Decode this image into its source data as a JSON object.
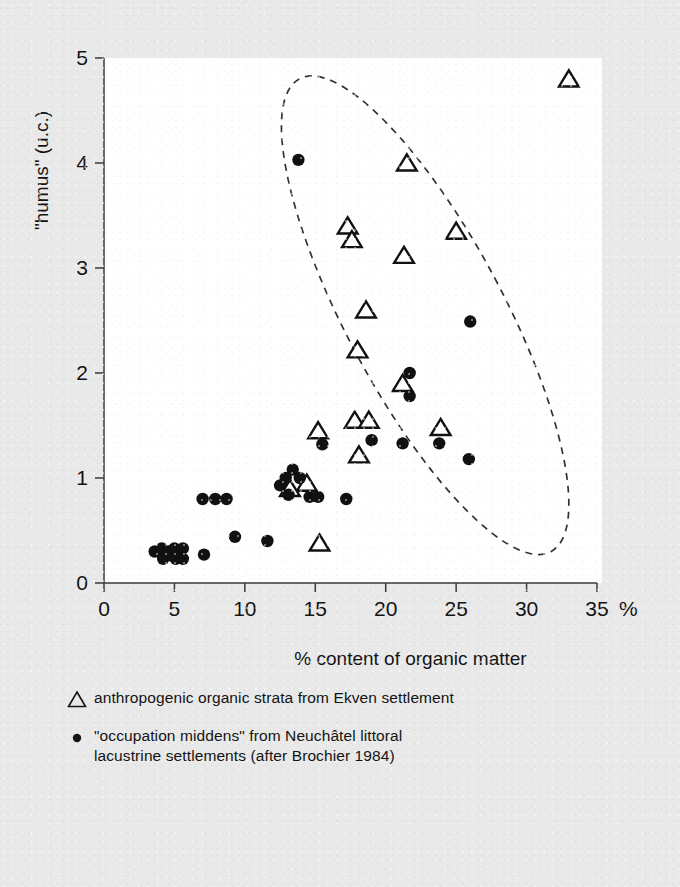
{
  "chart_data": {
    "type": "scatter",
    "title": "",
    "xlabel": "% content of organic matter",
    "ylabel": "\"humus\" (u.c.)",
    "x_unit_suffix": "%",
    "xlim": [
      0,
      35
    ],
    "ylim": [
      0,
      5
    ],
    "x_ticks": [
      "0",
      "5",
      "10",
      "15",
      "20",
      "25",
      "30",
      "35"
    ],
    "x_tick_values": [
      0,
      5,
      10,
      15,
      20,
      25,
      30,
      35
    ],
    "y_ticks": [
      "0",
      "1",
      "2",
      "3",
      "4",
      "5"
    ],
    "y_tick_values": [
      0,
      1,
      2,
      3,
      4,
      5
    ],
    "grid": false,
    "legend_position": "below-axes",
    "marker_color": "#111111",
    "annotation_color": "#333333",
    "series": [
      {
        "name": "anthropogenic organic strata from Ekven settlement",
        "marker": "triangle-open",
        "points": [
          [
            33.0,
            4.8
          ],
          [
            21.5,
            4.0
          ],
          [
            17.3,
            3.4
          ],
          [
            17.6,
            3.27
          ],
          [
            25.0,
            3.35
          ],
          [
            21.3,
            3.12
          ],
          [
            18.6,
            2.6
          ],
          [
            18.0,
            2.22
          ],
          [
            21.2,
            1.9
          ],
          [
            17.8,
            1.55
          ],
          [
            18.8,
            1.55
          ],
          [
            23.9,
            1.48
          ],
          [
            15.2,
            1.45
          ],
          [
            18.1,
            1.22
          ],
          [
            14.4,
            0.95
          ],
          [
            13.2,
            0.9
          ],
          [
            15.3,
            0.38
          ]
        ]
      },
      {
        "name": "\"occupation middens\" from Neuchâtel littoral lacustrine settlements (after Brochier 1984)",
        "marker": "circle-filled",
        "points": [
          [
            13.8,
            4.03
          ],
          [
            26.0,
            2.49
          ],
          [
            21.7,
            2.0
          ],
          [
            21.7,
            1.78
          ],
          [
            21.2,
            1.33
          ],
          [
            23.8,
            1.33
          ],
          [
            19.0,
            1.36
          ],
          [
            15.5,
            1.32
          ],
          [
            25.9,
            1.18
          ],
          [
            13.4,
            1.08
          ],
          [
            12.9,
            1.0
          ],
          [
            13.9,
            1.0
          ],
          [
            12.5,
            0.93
          ],
          [
            13.1,
            0.84
          ],
          [
            14.6,
            0.82
          ],
          [
            15.2,
            0.82
          ],
          [
            17.2,
            0.8
          ],
          [
            7.0,
            0.8
          ],
          [
            7.9,
            0.8
          ],
          [
            8.7,
            0.8
          ],
          [
            9.3,
            0.44
          ],
          [
            11.6,
            0.4
          ],
          [
            3.6,
            0.3
          ],
          [
            4.1,
            0.33
          ],
          [
            4.2,
            0.23
          ],
          [
            4.6,
            0.3
          ],
          [
            4.8,
            0.26
          ],
          [
            5.0,
            0.33
          ],
          [
            5.1,
            0.23
          ],
          [
            5.3,
            0.3
          ],
          [
            5.6,
            0.33
          ],
          [
            5.6,
            0.23
          ],
          [
            7.1,
            0.27
          ]
        ]
      }
    ],
    "annotations": [
      {
        "type": "ellipse-dashed",
        "label": "grouping-ellipse",
        "center_x": 22.8,
        "center_y": 2.55,
        "radius_x": 5.6,
        "radius_y": 2.55,
        "rotation_deg": -28
      }
    ]
  },
  "axes": {
    "y_axis_label": "\"humus\" (u.c.)",
    "x_axis_label": "% content of organic matter",
    "x_axis_unit": "%"
  },
  "legend": {
    "items": [
      {
        "marker": "triangle-open",
        "lines": [
          "anthropogenic organic strata from Ekven settlement"
        ]
      },
      {
        "marker": "circle-filled",
        "lines": [
          "\"occupation middens\" from Neuchâtel littoral",
          "lacustrine settlements (after Brochier 1984)"
        ]
      }
    ]
  }
}
